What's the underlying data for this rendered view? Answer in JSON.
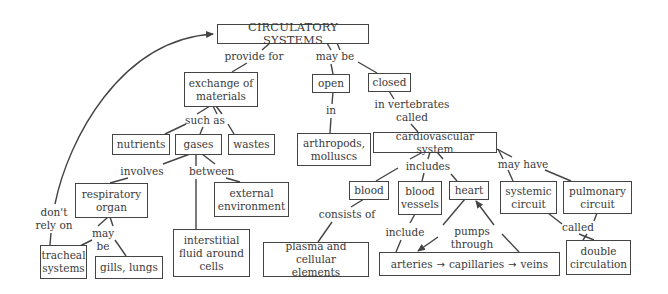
{
  "diagram": {
    "title": "CIRCULATORY SYSTEMS",
    "nodes": {
      "circulatory_systems": "CIRCULATORY SYSTEMS",
      "exchange_of_materials": "exchange of\nmaterials",
      "open": "open",
      "closed": "closed",
      "nutrients": "nutrients",
      "gases": "gases",
      "wastes": "wastes",
      "arthropods_molluscs": "arthropods,\nmolluscs",
      "cardiovascular_system": "cardiovascular system",
      "respiratory_organ": "respiratory\norgan",
      "external_environment": "external\nenvironment",
      "blood": "blood",
      "blood_vessels": "blood\nvessels",
      "heart": "heart",
      "systemic_circuit": "systemic\ncircuit",
      "pulmonary_circuit": "pulmonary\ncircuit",
      "tracheal_systems": "tracheal\nsystems",
      "gills_lungs": "gills, lungs",
      "interstitial_fluid": "interstitial\nfluid around\ncells",
      "plasma_cellular": "plasma and cellular\nelements",
      "vessel_chain": {
        "arteries": "arteries",
        "capillaries": "capillaries",
        "veins": "veins",
        "arrow": "→"
      },
      "double_circulation": "double\ncirculation"
    },
    "links": {
      "provide_for": "provide for",
      "may_be_top": "may be",
      "in": "in",
      "in_vertebrates_called": "in vertebrates\ncalled",
      "such_as": "such as",
      "involves": "involves",
      "between": "between",
      "includes": "includes",
      "may_have": "may have",
      "dont_rely_on": "don't\nrely on",
      "may_be_lower": "may be",
      "consists_of": "consists of",
      "include": "include",
      "pumps_through": "pumps through",
      "called": "called"
    },
    "colors": {
      "line": "#444444",
      "text": "#3a3a3a",
      "background": "#ffffff"
    }
  }
}
